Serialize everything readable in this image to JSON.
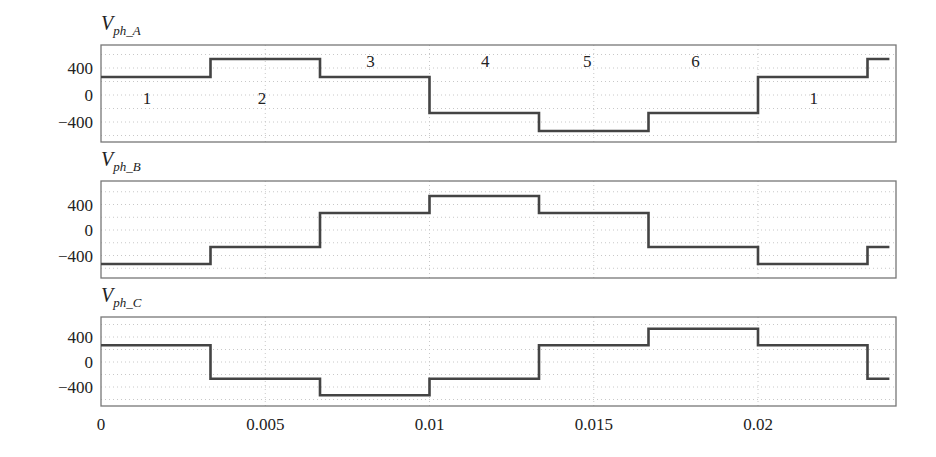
{
  "chart_data": {
    "type": "line",
    "subtype": "step",
    "xlabel": "",
    "xlim": [
      0,
      0.0242
    ],
    "xticks": [
      0,
      0.005,
      0.01,
      0.015,
      0.02
    ],
    "xtick_labels": [
      "0",
      "0.005",
      "0.01",
      "0.015",
      "0.02"
    ],
    "grid": true,
    "legend": null,
    "panels": [
      {
        "title": "V_ph_A",
        "title_main": "V",
        "title_sub": "ph_A",
        "ylabel": "",
        "ylim": [
          -800,
          800
        ],
        "yticks": [
          400,
          0,
          -400
        ],
        "ytick_labels": [
          "400",
          "0",
          "−400"
        ],
        "x": [
          0,
          0.003333,
          0.006667,
          0.01,
          0.013333,
          0.016667,
          0.02,
          0.023333,
          0.024
        ],
        "values": [
          267,
          533,
          267,
          -267,
          -533,
          -267,
          267,
          533,
          533
        ],
        "annotations": [
          {
            "text": "1",
            "x": 0.0014,
            "y": -50
          },
          {
            "text": "2",
            "x": 0.0049,
            "y": -50
          },
          {
            "text": "3",
            "x": 0.0082,
            "y": 500
          },
          {
            "text": "4",
            "x": 0.0117,
            "y": 500
          },
          {
            "text": "5",
            "x": 0.0148,
            "y": 500
          },
          {
            "text": "6",
            "x": 0.0181,
            "y": 500
          },
          {
            "text": "1",
            "x": 0.0217,
            "y": -50
          }
        ]
      },
      {
        "title": "V_ph_B",
        "title_main": "V",
        "title_sub": "ph_B",
        "ylabel": "",
        "ylim": [
          -800,
          800
        ],
        "yticks": [
          400,
          0,
          -400
        ],
        "ytick_labels": [
          "400",
          "0",
          "−400"
        ],
        "x": [
          0,
          0.003333,
          0.006667,
          0.01,
          0.013333,
          0.016667,
          0.02,
          0.023333,
          0.024
        ],
        "values": [
          -533,
          -267,
          267,
          533,
          267,
          -267,
          -533,
          -267,
          -267
        ]
      },
      {
        "title": "V_ph_C",
        "title_main": "V",
        "title_sub": "ph_C",
        "ylabel": "",
        "ylim": [
          -800,
          800
        ],
        "yticks": [
          400,
          0,
          -400
        ],
        "ytick_labels": [
          "400",
          "0",
          "−400"
        ],
        "x": [
          0,
          0.003333,
          0.006667,
          0.01,
          0.013333,
          0.016667,
          0.02,
          0.023333,
          0.024
        ],
        "values": [
          267,
          -267,
          -533,
          -267,
          267,
          533,
          267,
          -267,
          -267
        ]
      }
    ]
  },
  "style": {
    "line_color": "#444444",
    "frame_color": "#777777",
    "grid_color": "#c8c8c8"
  }
}
